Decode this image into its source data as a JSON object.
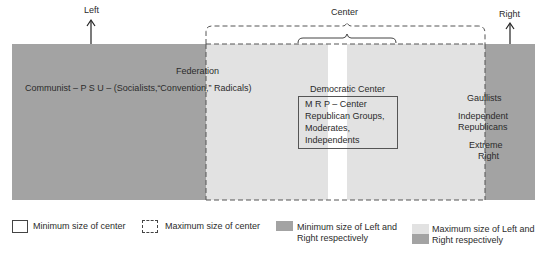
{
  "diagram": {
    "axis_labels": {
      "left": "Left",
      "center": "Center",
      "right": "Right"
    },
    "regions": [
      {
        "name": "left-minimum",
        "color": "#a3a3a3"
      },
      {
        "name": "center-maximum",
        "color": "#e2e2e2"
      },
      {
        "name": "center-divider",
        "color": "#ffffff"
      },
      {
        "name": "right-minimum",
        "color": "#a3a3a3"
      }
    ],
    "party_labels": {
      "federation": "Federation",
      "left_parties": "Communist – P S U – (Socialists,“Convention,” Radicals)",
      "democratic_center": "Democratic Center",
      "center_box_lines": [
        "M R P  – Center",
        "Republican Groups,",
        "Moderates,",
        "Independents"
      ],
      "gaullists": "Gaullists",
      "independent_republicans": [
        "Independent",
        "Republicans"
      ],
      "extreme_right": [
        "Extreme",
        "Right"
      ]
    }
  },
  "legend": {
    "items": [
      {
        "label": "Minimum size of center",
        "style": "solid-outline"
      },
      {
        "label": "Maximum size of center",
        "style": "dashed-outline"
      },
      {
        "label_lines": [
          "Minimum size of Left and",
          "Right respectively"
        ],
        "style": "dark-fill",
        "color": "#a3a3a3"
      },
      {
        "label_lines": [
          "Maximum size of Left and",
          "Right respectively"
        ],
        "style": "light-over-dark",
        "colors": [
          "#e2e2e2",
          "#a3a3a3"
        ]
      }
    ]
  }
}
